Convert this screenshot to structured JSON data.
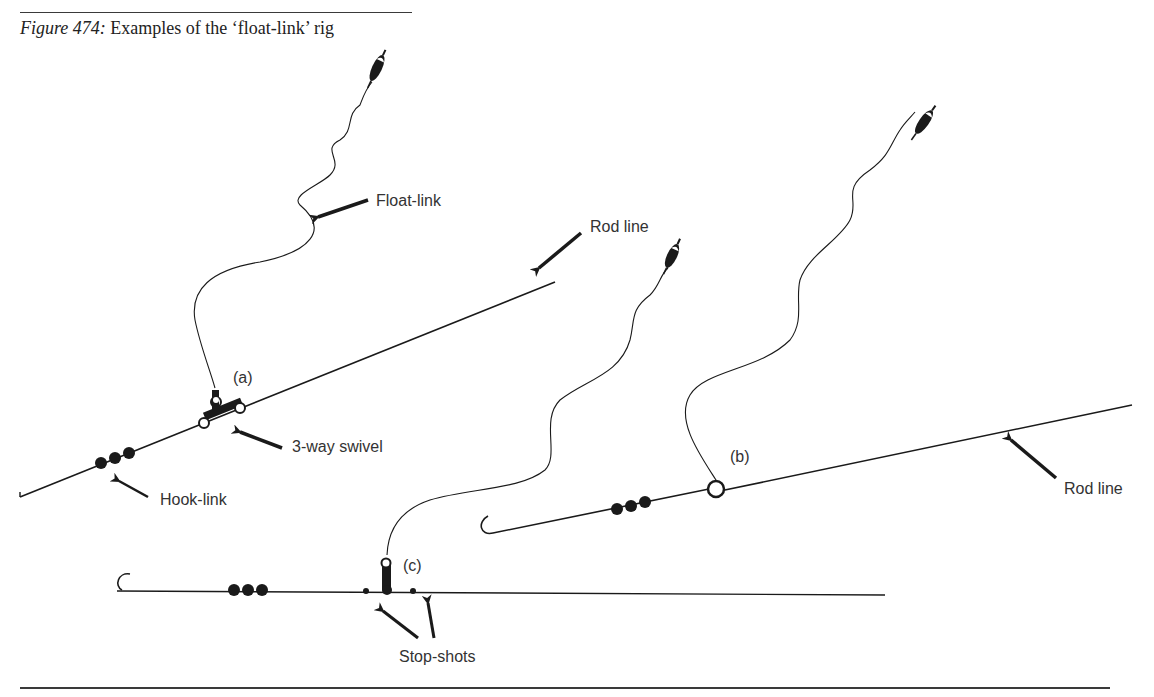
{
  "caption": {
    "figure_number": "Figure 474:",
    "title": "Examples of the ‘float-link’ rig"
  },
  "labels": {
    "float_link": "Float-link",
    "rod_line_a": "Rod line",
    "rig_a": "(a)",
    "three_way_swivel": "3-way swivel",
    "hook_link": "Hook-link",
    "rig_b": "(b)",
    "rod_line_b": "Rod line",
    "rig_c": "(c)",
    "stop_shots": "Stop-shots"
  },
  "rigs": [
    {
      "id": "a",
      "components": [
        "float",
        "float-link",
        "3-way swivel",
        "rod line",
        "hook-link",
        "split shots",
        "hook"
      ]
    },
    {
      "id": "b",
      "components": [
        "float",
        "float-link",
        "ring",
        "rod line",
        "split shots",
        "hook"
      ]
    },
    {
      "id": "c",
      "components": [
        "float",
        "float-link",
        "swivel",
        "stop-shots",
        "split shots",
        "hook"
      ]
    }
  ],
  "colors": {
    "ink": "#1a1a1a",
    "text": "#333333",
    "background": "#ffffff"
  }
}
